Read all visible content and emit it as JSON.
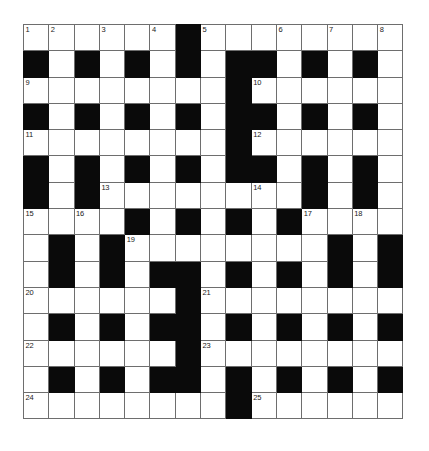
{
  "puzzle": {
    "type": "crossword-grid",
    "rows": 15,
    "cols": 15,
    "cell_size_px": 25,
    "colors": {
      "block": "#0a0a0a",
      "empty": "#ffffff",
      "gridline": "#6e6e6e",
      "number": "#1a1a1a",
      "page_background": "#ffffff"
    },
    "grid": [
      [
        "0",
        "0",
        "0",
        "0",
        "0",
        "0",
        "#",
        "0",
        "0",
        "0",
        "0",
        "0",
        "0",
        "0",
        "0"
      ],
      [
        "#",
        "0",
        "#",
        "0",
        "#",
        "0",
        "#",
        "0",
        "#",
        "#",
        "0",
        "#",
        "0",
        "#",
        "0"
      ],
      [
        "0",
        "0",
        "0",
        "0",
        "0",
        "0",
        "0",
        "0",
        "#",
        "0",
        "0",
        "0",
        "0",
        "0",
        "0"
      ],
      [
        "#",
        "0",
        "#",
        "0",
        "#",
        "0",
        "#",
        "0",
        "#",
        "#",
        "0",
        "#",
        "0",
        "#",
        "0"
      ],
      [
        "0",
        "0",
        "0",
        "0",
        "0",
        "0",
        "0",
        "0",
        "#",
        "0",
        "0",
        "0",
        "0",
        "0",
        "0"
      ],
      [
        "#",
        "0",
        "#",
        "0",
        "#",
        "0",
        "#",
        "0",
        "#",
        "#",
        "0",
        "#",
        "0",
        "#",
        "0"
      ],
      [
        "#",
        "0",
        "#",
        "0",
        "0",
        "0",
        "0",
        "0",
        "0",
        "0",
        "0",
        "#",
        "0",
        "#",
        "0"
      ],
      [
        "0",
        "0",
        "0",
        "0",
        "#",
        "0",
        "#",
        "0",
        "#",
        "0",
        "#",
        "0",
        "0",
        "0",
        "0"
      ],
      [
        "0",
        "#",
        "0",
        "#",
        "0",
        "0",
        "0",
        "0",
        "0",
        "0",
        "0",
        "0",
        "#",
        "0",
        "#"
      ],
      [
        "0",
        "#",
        "0",
        "#",
        "0",
        "#",
        "#",
        "0",
        "#",
        "0",
        "#",
        "0",
        "#",
        "0",
        "#"
      ],
      [
        "0",
        "0",
        "0",
        "0",
        "0",
        "0",
        "#",
        "0",
        "0",
        "0",
        "0",
        "0",
        "0",
        "0",
        "0"
      ],
      [
        "0",
        "#",
        "0",
        "#",
        "0",
        "#",
        "#",
        "0",
        "#",
        "0",
        "#",
        "0",
        "#",
        "0",
        "#"
      ],
      [
        "0",
        "0",
        "0",
        "0",
        "0",
        "0",
        "#",
        "0",
        "0",
        "0",
        "0",
        "0",
        "0",
        "0",
        "0"
      ],
      [
        "0",
        "#",
        "0",
        "#",
        "0",
        "#",
        "#",
        "0",
        "#",
        "0",
        "#",
        "0",
        "#",
        "0",
        "#"
      ],
      [
        "0",
        "0",
        "0",
        "0",
        "0",
        "0",
        "0",
        "0",
        "#",
        "0",
        "0",
        "0",
        "0",
        "0",
        "0"
      ]
    ],
    "numbers": [
      {
        "row": 0,
        "col": 0,
        "label": "1"
      },
      {
        "row": 0,
        "col": 1,
        "label": "2"
      },
      {
        "row": 0,
        "col": 3,
        "label": "3"
      },
      {
        "row": 0,
        "col": 5,
        "label": "4"
      },
      {
        "row": 0,
        "col": 7,
        "label": "5"
      },
      {
        "row": 0,
        "col": 10,
        "label": "6"
      },
      {
        "row": 0,
        "col": 12,
        "label": "7"
      },
      {
        "row": 0,
        "col": 14,
        "label": "8"
      },
      {
        "row": 2,
        "col": 0,
        "label": "9"
      },
      {
        "row": 2,
        "col": 9,
        "label": "10"
      },
      {
        "row": 4,
        "col": 0,
        "label": "11"
      },
      {
        "row": 4,
        "col": 9,
        "label": "12"
      },
      {
        "row": 6,
        "col": 3,
        "label": "13"
      },
      {
        "row": 6,
        "col": 9,
        "label": "14"
      },
      {
        "row": 7,
        "col": 0,
        "label": "15"
      },
      {
        "row": 7,
        "col": 2,
        "label": "16"
      },
      {
        "row": 7,
        "col": 11,
        "label": "17"
      },
      {
        "row": 7,
        "col": 13,
        "label": "18"
      },
      {
        "row": 8,
        "col": 4,
        "label": "19"
      },
      {
        "row": 10,
        "col": 0,
        "label": "20"
      },
      {
        "row": 10,
        "col": 7,
        "label": "21"
      },
      {
        "row": 12,
        "col": 0,
        "label": "22"
      },
      {
        "row": 12,
        "col": 7,
        "label": "23"
      },
      {
        "row": 14,
        "col": 0,
        "label": "24"
      },
      {
        "row": 14,
        "col": 9,
        "label": "25"
      }
    ]
  }
}
